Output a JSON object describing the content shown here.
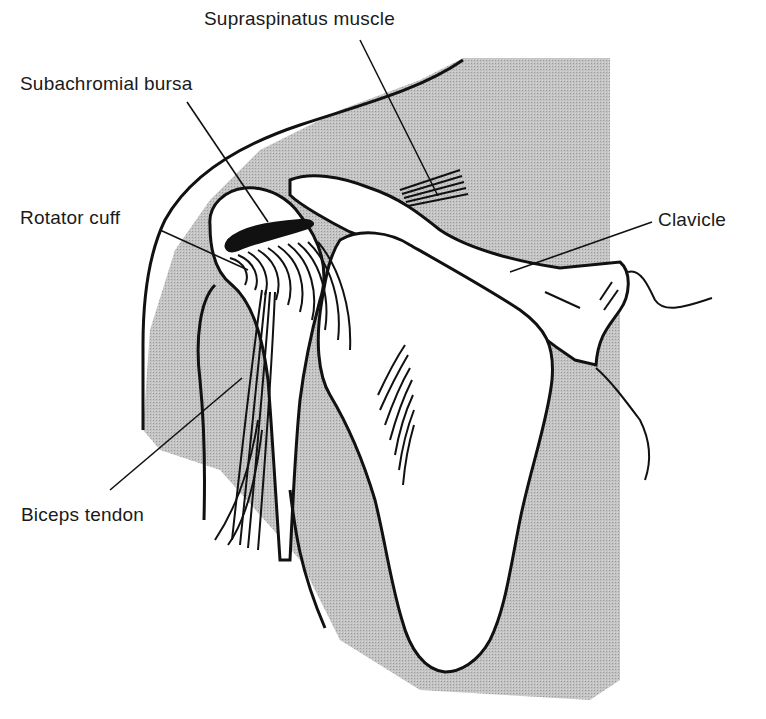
{
  "diagram": {
    "labels": [
      {
        "id": "supraspinatus",
        "text": "Supraspinatus muscle",
        "x": 204,
        "y": 8
      },
      {
        "id": "subachromial",
        "text": "Subachromial bursa",
        "x": 20,
        "y": 73
      },
      {
        "id": "rotator",
        "text": "Rotator cuff",
        "x": 20,
        "y": 207
      },
      {
        "id": "clavicle",
        "text": "Clavicle",
        "x": 658,
        "y": 209
      },
      {
        "id": "biceps",
        "text": "Biceps tendon",
        "x": 21,
        "y": 504
      }
    ],
    "colors": {
      "ink": "#111111",
      "shade": "#bdbdbd",
      "background": "#ffffff"
    }
  }
}
